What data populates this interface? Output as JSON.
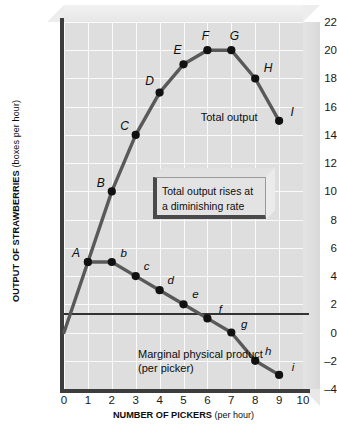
{
  "chart_data": {
    "type": "line",
    "title": "",
    "xlabel": "NUMBER OF PICKERS",
    "xlabel_unit": "(per hour)",
    "ylabel": "OUTPUT OF STRAWBERRIES",
    "ylabel_unit": "(boxes per hour)",
    "xlim": [
      0,
      10
    ],
    "ylim": [
      -4,
      22
    ],
    "xticks": [
      "0",
      "1",
      "2",
      "3",
      "4",
      "5",
      "6",
      "7",
      "8",
      "9",
      "10"
    ],
    "yticks": [
      "22",
      "20",
      "18",
      "16",
      "14",
      "12",
      "10",
      "8",
      "6",
      "4",
      "2",
      "0",
      "–2",
      "–4"
    ],
    "grid": true,
    "legend_position": "inline-annotations",
    "series": [
      {
        "name": "Total output",
        "point_labels": [
          "A",
          "B",
          "C",
          "D",
          "E",
          "F",
          "G",
          "H",
          "I"
        ],
        "x": [
          1,
          2,
          3,
          4,
          5,
          6,
          7,
          8,
          9
        ],
        "values": [
          5,
          10,
          14,
          17,
          19,
          20,
          20,
          18,
          15
        ],
        "origin": [
          0,
          0
        ]
      },
      {
        "name": "Marginal physical product (per picker)",
        "point_labels": [
          "A",
          "b",
          "c",
          "d",
          "e",
          "f",
          "g",
          "h",
          "i"
        ],
        "x": [
          1,
          2,
          3,
          4,
          5,
          6,
          7,
          8,
          9
        ],
        "values": [
          5,
          5,
          4,
          3,
          2,
          1,
          0,
          -2,
          -3
        ]
      }
    ],
    "annotations": [
      {
        "text": "Total output",
        "x": 8.1,
        "y": 15.2
      },
      {
        "text": "Marginal physical product",
        "x": 3.1,
        "y": -1.6
      },
      {
        "text": "(per picker)",
        "x": 3.1,
        "y": -2.6
      }
    ],
    "callout": {
      "line1": "Total output rises at",
      "line2": "a diminishing rate"
    },
    "colors": {
      "plot_background": "#dedede",
      "gridline": "#fafafa",
      "axis": "#3d3d3d",
      "series_line": "#595959",
      "marker": "#111111",
      "zero_line": "#333333",
      "callout_fill": "#e3e3e3",
      "callout_shadow": "#4a4a4a"
    }
  }
}
